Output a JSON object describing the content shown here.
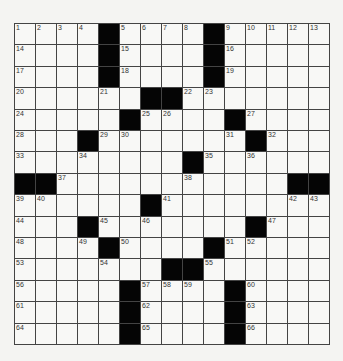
{
  "puzzle": {
    "rows": 15,
    "cols": 15,
    "colors": {
      "black": "#050505",
      "white": "#f8f8f6",
      "line": "#444444",
      "background": "#f4f4f2"
    },
    "grid": [
      "....#....#.....",
      "....#....#.....",
      "....#....#.....",
      "......##.......",
      ".....#....#....",
      "...#.......#...",
      "........#......",
      "##...........##",
      "......#........",
      "...#.......#...",
      "....#....#.....",
      ".......##......",
      ".....#....#....",
      ".....#....#....",
      ".....#....#...."
    ],
    "numbers": [
      {
        "r": 0,
        "c": 0,
        "n": "1"
      },
      {
        "r": 0,
        "c": 1,
        "n": "2"
      },
      {
        "r": 0,
        "c": 2,
        "n": "3"
      },
      {
        "r": 0,
        "c": 3,
        "n": "4"
      },
      {
        "r": 0,
        "c": 5,
        "n": "5"
      },
      {
        "r": 0,
        "c": 6,
        "n": "6"
      },
      {
        "r": 0,
        "c": 7,
        "n": "7"
      },
      {
        "r": 0,
        "c": 8,
        "n": "8"
      },
      {
        "r": 0,
        "c": 10,
        "n": "9"
      },
      {
        "r": 0,
        "c": 11,
        "n": "10"
      },
      {
        "r": 0,
        "c": 12,
        "n": "11"
      },
      {
        "r": 0,
        "c": 13,
        "n": "12"
      },
      {
        "r": 0,
        "c": 14,
        "n": "13"
      },
      {
        "r": 1,
        "c": 0,
        "n": "14"
      },
      {
        "r": 1,
        "c": 5,
        "n": "15"
      },
      {
        "r": 1,
        "c": 10,
        "n": "16"
      },
      {
        "r": 2,
        "c": 0,
        "n": "17"
      },
      {
        "r": 2,
        "c": 5,
        "n": "18"
      },
      {
        "r": 2,
        "c": 10,
        "n": "19"
      },
      {
        "r": 3,
        "c": 0,
        "n": "20"
      },
      {
        "r": 3,
        "c": 4,
        "n": "21"
      },
      {
        "r": 3,
        "c": 8,
        "n": "22"
      },
      {
        "r": 3,
        "c": 9,
        "n": "23"
      },
      {
        "r": 4,
        "c": 0,
        "n": "24"
      },
      {
        "r": 4,
        "c": 6,
        "n": "25"
      },
      {
        "r": 4,
        "c": 7,
        "n": "26"
      },
      {
        "r": 4,
        "c": 11,
        "n": "27"
      },
      {
        "r": 5,
        "c": 0,
        "n": "28"
      },
      {
        "r": 5,
        "c": 4,
        "n": "29"
      },
      {
        "r": 5,
        "c": 5,
        "n": "30"
      },
      {
        "r": 5,
        "c": 10,
        "n": "31"
      },
      {
        "r": 5,
        "c": 12,
        "n": "32"
      },
      {
        "r": 6,
        "c": 0,
        "n": "33"
      },
      {
        "r": 6,
        "c": 3,
        "n": "34"
      },
      {
        "r": 6,
        "c": 9,
        "n": "35"
      },
      {
        "r": 6,
        "c": 11,
        "n": "36"
      },
      {
        "r": 7,
        "c": 2,
        "n": "37"
      },
      {
        "r": 7,
        "c": 8,
        "n": "38"
      },
      {
        "r": 8,
        "c": 0,
        "n": "39"
      },
      {
        "r": 8,
        "c": 1,
        "n": "40"
      },
      {
        "r": 8,
        "c": 7,
        "n": "41"
      },
      {
        "r": 8,
        "c": 13,
        "n": "42"
      },
      {
        "r": 8,
        "c": 14,
        "n": "43"
      },
      {
        "r": 9,
        "c": 0,
        "n": "44"
      },
      {
        "r": 9,
        "c": 4,
        "n": "45"
      },
      {
        "r": 9,
        "c": 6,
        "n": "46"
      },
      {
        "r": 9,
        "c": 12,
        "n": "47"
      },
      {
        "r": 10,
        "c": 0,
        "n": "48"
      },
      {
        "r": 10,
        "c": 3,
        "n": "49"
      },
      {
        "r": 10,
        "c": 5,
        "n": "50"
      },
      {
        "r": 10,
        "c": 10,
        "n": "51"
      },
      {
        "r": 10,
        "c": 11,
        "n": "52"
      },
      {
        "r": 11,
        "c": 0,
        "n": "53"
      },
      {
        "r": 11,
        "c": 4,
        "n": "54"
      },
      {
        "r": 11,
        "c": 9,
        "n": "55"
      },
      {
        "r": 12,
        "c": 0,
        "n": "56"
      },
      {
        "r": 12,
        "c": 6,
        "n": "57"
      },
      {
        "r": 12,
        "c": 7,
        "n": "58"
      },
      {
        "r": 12,
        "c": 8,
        "n": "59"
      },
      {
        "r": 12,
        "c": 11,
        "n": "60"
      },
      {
        "r": 13,
        "c": 0,
        "n": "61"
      },
      {
        "r": 13,
        "c": 6,
        "n": "62"
      },
      {
        "r": 13,
        "c": 11,
        "n": "63"
      },
      {
        "r": 14,
        "c": 0,
        "n": "64"
      },
      {
        "r": 14,
        "c": 6,
        "n": "65"
      },
      {
        "r": 14,
        "c": 11,
        "n": "66"
      }
    ]
  }
}
